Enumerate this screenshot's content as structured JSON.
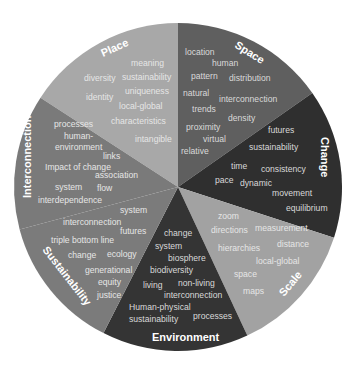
{
  "diagram": {
    "type": "concept-wheel",
    "center": [
      178,
      187
    ],
    "radius": 164,
    "segments": [
      {
        "id": "place",
        "title": "Place",
        "color": "#a8a8a8",
        "terms": [
          "meaning",
          "diversity",
          "sustainability",
          "identity",
          "uniqueness",
          "local-global",
          "characteristics",
          "intangible"
        ]
      },
      {
        "id": "space",
        "title": "Space",
        "color": "#5f5f5f",
        "terms": [
          "location",
          "human",
          "pattern",
          "distribution",
          "natural",
          "interconnection",
          "trends",
          "density",
          "proximity",
          "virtual",
          "relative"
        ]
      },
      {
        "id": "change",
        "title": "Change",
        "color": "#2f2f2f",
        "terms": [
          "futures",
          "sustainability",
          "time",
          "consistency",
          "pace",
          "dynamic",
          "movement",
          "equilibrium"
        ]
      },
      {
        "id": "scale",
        "title": "Scale",
        "color": "#a2a2a2",
        "terms": [
          "zoom",
          "directions",
          "measurement",
          "hierarchies",
          "distance",
          "local-global",
          "space",
          "maps"
        ]
      },
      {
        "id": "environment",
        "title": "Environment",
        "color": "#343434",
        "terms": [
          "change",
          "system",
          "biosphere",
          "biodiversity",
          "living",
          "non-living",
          "interconnection",
          "Human-physical",
          "processes",
          "sustainability"
        ]
      },
      {
        "id": "sustainability",
        "title": "Sustainability",
        "color": "#7b7b7b",
        "terms": [
          "system",
          "interconnection",
          "futures",
          "triple bottom line",
          "change",
          "ecology",
          "generational",
          "equity",
          "justice"
        ]
      },
      {
        "id": "interconnection",
        "title": "Interconnection",
        "color": "#7a7a7a",
        "terms": [
          "processes",
          "human-",
          "environment",
          "links",
          "Impact of change",
          "association",
          "system",
          "flow",
          "interdependence"
        ]
      }
    ]
  }
}
